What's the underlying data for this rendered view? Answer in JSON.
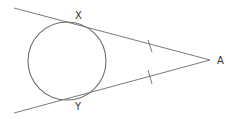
{
  "diagram": {
    "type": "geometry",
    "points": {
      "tangent_point_upper": "X",
      "tangent_point_lower": "Y",
      "external_point": "A"
    },
    "marks": {
      "equal_length_ticks": [
        "AX",
        "AY"
      ]
    },
    "colors": {
      "line": "#7a7a7a",
      "circle": "#6e6e6e",
      "label": "#333333"
    }
  }
}
